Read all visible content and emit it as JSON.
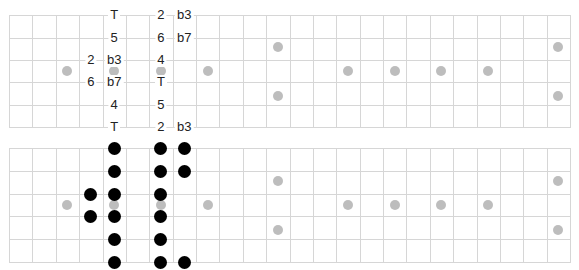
{
  "layout": {
    "grid_left": 9,
    "grid_right": 570,
    "frets": 24,
    "strings": 6,
    "top_board_y": [
      15,
      38,
      60,
      82,
      105,
      127
    ],
    "bottom_board_y": [
      148,
      171,
      194,
      216,
      239,
      262
    ]
  },
  "colors": {
    "grid_line": "#d6d6d6",
    "inlay": "#bdbdbd",
    "note_dot": "#000000",
    "label_text": "#222222"
  },
  "inlays": {
    "single_frets": [
      2,
      4,
      6,
      8,
      14,
      16,
      18,
      20
    ],
    "double_frets": [
      11,
      23
    ]
  },
  "top_board": {
    "title": "Interval labels",
    "labels": [
      {
        "string": 0,
        "fret": 4,
        "text": "T"
      },
      {
        "string": 0,
        "fret": 6,
        "text": "2"
      },
      {
        "string": 0,
        "fret": 7,
        "text": "b3"
      },
      {
        "string": 1,
        "fret": 4,
        "text": "5"
      },
      {
        "string": 1,
        "fret": 6,
        "text": "6"
      },
      {
        "string": 1,
        "fret": 7,
        "text": "b7"
      },
      {
        "string": 2,
        "fret": 3,
        "text": "2"
      },
      {
        "string": 2,
        "fret": 4,
        "text": "b3"
      },
      {
        "string": 2,
        "fret": 6,
        "text": "4"
      },
      {
        "string": 3,
        "fret": 3,
        "text": "6"
      },
      {
        "string": 3,
        "fret": 4,
        "text": "b7"
      },
      {
        "string": 3,
        "fret": 6,
        "text": "T"
      },
      {
        "string": 4,
        "fret": 4,
        "text": "4"
      },
      {
        "string": 4,
        "fret": 6,
        "text": "5"
      },
      {
        "string": 5,
        "fret": 4,
        "text": "T"
      },
      {
        "string": 5,
        "fret": 6,
        "text": "2"
      },
      {
        "string": 5,
        "fret": 7,
        "text": "b3"
      }
    ]
  },
  "bottom_board": {
    "title": "Note dots",
    "dots": [
      {
        "string": 0,
        "fret": 4
      },
      {
        "string": 0,
        "fret": 6
      },
      {
        "string": 0,
        "fret": 7
      },
      {
        "string": 1,
        "fret": 4
      },
      {
        "string": 1,
        "fret": 6
      },
      {
        "string": 1,
        "fret": 7
      },
      {
        "string": 2,
        "fret": 3
      },
      {
        "string": 2,
        "fret": 4
      },
      {
        "string": 2,
        "fret": 6
      },
      {
        "string": 3,
        "fret": 3
      },
      {
        "string": 3,
        "fret": 4
      },
      {
        "string": 3,
        "fret": 6
      },
      {
        "string": 4,
        "fret": 4
      },
      {
        "string": 4,
        "fret": 6
      },
      {
        "string": 5,
        "fret": 4
      },
      {
        "string": 5,
        "fret": 6
      },
      {
        "string": 5,
        "fret": 7
      }
    ]
  }
}
